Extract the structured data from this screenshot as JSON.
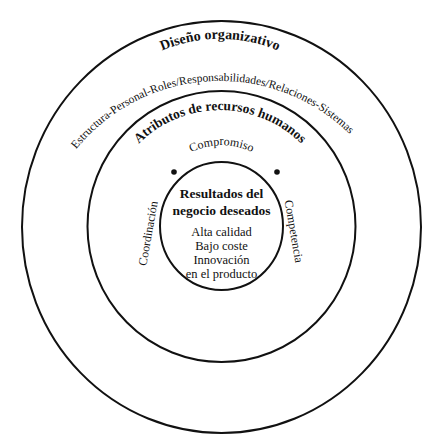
{
  "diagram": {
    "rings": [
      {
        "id": "outer",
        "title": "Diseño organizativo",
        "subtitle": "Estructura-Personal-Roles/Responsabilidades/Relaciones-Sistemas"
      },
      {
        "id": "middle",
        "title": "Atributos de recursos humanos",
        "attributes": {
          "top": "Compromiso",
          "left": "Coordinación",
          "right": "Competencia"
        }
      },
      {
        "id": "inner",
        "title_line1": "Resultados del",
        "title_line2": "negocio deseados",
        "items": [
          "Alta calidad",
          "Bajo coste",
          "Innovación",
          "en el producto"
        ]
      }
    ],
    "colors": {
      "stroke": "#111111",
      "text": "#111111",
      "background": "#ffffff"
    }
  }
}
